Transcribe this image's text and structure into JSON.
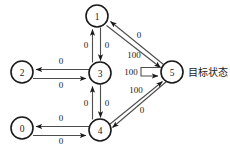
{
  "diagram": {
    "type": "state-transition-graph",
    "background_color": "#ffffff",
    "node_stroke_color": "#1a1a1a",
    "edge_color": "#4d4d4d",
    "goal_annotation": "目标状态",
    "nodes": [
      {
        "id": "1",
        "label": "1",
        "cx": 97,
        "cy": 16,
        "r": 11
      },
      {
        "id": "2",
        "label": "2",
        "cx": 22,
        "cy": 72,
        "r": 11
      },
      {
        "id": "3",
        "label": "3",
        "cx": 100,
        "cy": 73,
        "r": 11
      },
      {
        "id": "0",
        "label": "0",
        "cx": 22,
        "cy": 128,
        "r": 11
      },
      {
        "id": "4",
        "label": "4",
        "cx": 100,
        "cy": 130,
        "r": 11
      },
      {
        "id": "5",
        "label": "5",
        "cx": 172,
        "cy": 72,
        "r": 11
      }
    ],
    "edges": [
      {
        "from": "3",
        "to": "1",
        "label": "0",
        "label_x": 86,
        "label_y": 45
      },
      {
        "from": "1",
        "to": "3",
        "label": "0",
        "label_x": 107,
        "label_y": 45
      },
      {
        "from": "3",
        "to": "2",
        "label": "0",
        "label_x": 61,
        "label_y": 61
      },
      {
        "from": "2",
        "to": "3",
        "label": "0",
        "label_x": 61,
        "label_y": 85
      },
      {
        "from": "4",
        "to": "3",
        "label": "0",
        "label_x": 86,
        "label_y": 103
      },
      {
        "from": "3",
        "to": "4",
        "label": "0",
        "label_x": 107,
        "label_y": 103
      },
      {
        "from": "4",
        "to": "0",
        "label": "0",
        "label_x": 61,
        "label_y": 118
      },
      {
        "from": "0",
        "to": "4",
        "label": "0",
        "label_x": 61,
        "label_y": 141
      },
      {
        "from": "5",
        "to": "1",
        "label": "0",
        "label_x": 139,
        "label_y": 35
      },
      {
        "from": "1",
        "to": "5",
        "label": "100",
        "label_x": 134,
        "label_y": 55
      },
      {
        "from": "4",
        "to": "5",
        "label": "100",
        "label_x": 136,
        "label_y": 90
      },
      {
        "from": "5",
        "to": "4",
        "label": "0",
        "label_x": 142,
        "label_y": 110
      },
      {
        "from": "5",
        "to": "5",
        "label": "100",
        "label_x": 131,
        "label_y": 72
      }
    ]
  }
}
